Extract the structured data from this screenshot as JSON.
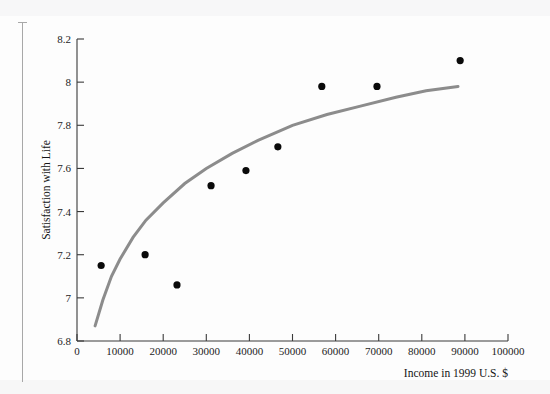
{
  "figure": {
    "background_color": "#fdfdfd",
    "margin_rule_color": "#a8a8a8"
  },
  "chart_data": {
    "type": "scatter",
    "title": "",
    "subtitle": "",
    "xlabel": "Income in 1999 U.S. $",
    "ylabel": "Satisfaction with Life",
    "xlim": [
      0,
      100000
    ],
    "ylim": [
      6.8,
      8.2
    ],
    "xticks": [
      0,
      10000,
      20000,
      30000,
      40000,
      50000,
      60000,
      70000,
      80000,
      90000,
      100000
    ],
    "xtick_labels": [
      "0",
      "10000",
      "20000",
      "30000",
      "40000",
      "50000",
      "60000",
      "70000",
      "80000",
      "90000",
      "100000"
    ],
    "yticks": [
      6.8,
      7,
      7.2,
      7.4,
      7.6,
      7.8,
      8,
      8.2
    ],
    "ytick_labels": [
      "6.8",
      "7",
      "7.2",
      "7.4",
      "7.6",
      "7.8",
      "8",
      "8.2"
    ],
    "grid": false,
    "legend": null,
    "point_color": "#0a0a0a",
    "point_radius": 3.6,
    "points": [
      {
        "x": 5600,
        "y": 7.15
      },
      {
        "x": 15800,
        "y": 7.2
      },
      {
        "x": 23200,
        "y": 7.06
      },
      {
        "x": 31100,
        "y": 7.52
      },
      {
        "x": 39200,
        "y": 7.59
      },
      {
        "x": 46600,
        "y": 7.7
      },
      {
        "x": 56800,
        "y": 7.98
      },
      {
        "x": 69600,
        "y": 7.98
      },
      {
        "x": 88900,
        "y": 8.1
      }
    ],
    "series": [
      {
        "name": "fitted-logarithmic-curve",
        "type": "line",
        "color": "#8c8c8c",
        "width": 3,
        "x": [
          4200,
          6000,
          8000,
          10000,
          13000,
          16000,
          20000,
          25000,
          30000,
          36000,
          42000,
          50000,
          58000,
          66000,
          74000,
          81000,
          88400
        ],
        "y": [
          6.87,
          6.99,
          7.1,
          7.18,
          7.28,
          7.36,
          7.44,
          7.53,
          7.6,
          7.67,
          7.73,
          7.8,
          7.85,
          7.89,
          7.93,
          7.96,
          7.98
        ]
      }
    ]
  }
}
